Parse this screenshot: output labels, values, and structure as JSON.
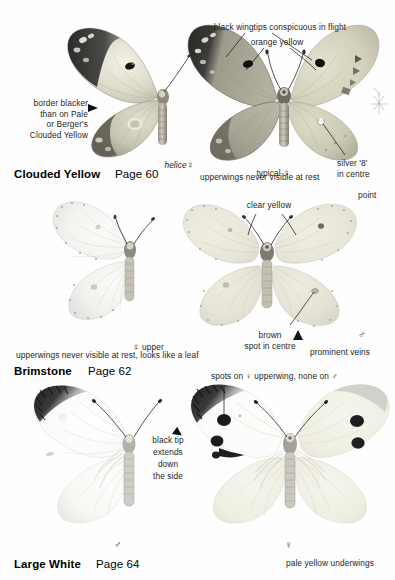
{
  "page": {
    "width": 395,
    "height": 580,
    "background": "#fefefe",
    "ink": "#1b1b1b"
  },
  "sections": [
    {
      "id": "clouded-yellow",
      "species_name": "Clouded Yellow",
      "page_ref": "Page 60",
      "specimens": [
        {
          "id": "helice-female",
          "caption": "helice",
          "sex_symbol": "♀",
          "form": "helice",
          "view": "upperside-left-half",
          "colors": {
            "wing": "#e8e3d4",
            "border": "#3a3a3a",
            "spot": "#1a1a1a"
          }
        },
        {
          "id": "typical-female",
          "caption": "typical",
          "sex_symbol": "♀",
          "form": "typical",
          "view": "split-upper-and-under",
          "colors": {
            "upper_wing": "#b9b4a4",
            "under_wing": "#d8d7c2",
            "border": "#2e2e2e",
            "spot": "#141414"
          }
        }
      ],
      "callouts": [
        {
          "id": "border-blacker",
          "text": "border blacker\nthan on Pale\nor Berger's\nClouded Yellow",
          "pointer": "arrow-right"
        },
        {
          "id": "black-wingtips",
          "text": "black wingtips conspicuous in flight",
          "pointer": "lines-to-both-forewings"
        },
        {
          "id": "orange-yellow",
          "text": "orange yellow",
          "pointer": "lines-to-wings"
        },
        {
          "id": "silver-8",
          "text": "silver '8'\nin centre",
          "pointer": "line-up-left"
        },
        {
          "id": "upperwings-note",
          "text": "upperwings never visible at rest",
          "pointer": "none"
        }
      ]
    },
    {
      "id": "brimstone",
      "species_name": "Brimstone",
      "page_ref": "Page 62",
      "specimens": [
        {
          "id": "female-upper",
          "caption": "upper",
          "sex_symbol": "♀",
          "view": "upperside-left-half",
          "colors": {
            "wing": "#f3f4f0",
            "vein": "#d3d5cf",
            "spot": "#cfd2cb"
          }
        },
        {
          "id": "male",
          "caption": "",
          "sex_symbol": "♂",
          "view": "underside-full",
          "colors": {
            "wing": "#ebe9df",
            "vein": "#d6d4c8",
            "spot": "#9a968a"
          }
        }
      ],
      "callouts": [
        {
          "id": "clear-yellow",
          "text": "clear yellow",
          "pointer": "lines-to-both-forewings"
        },
        {
          "id": "point",
          "text": "point",
          "pointer": "none"
        },
        {
          "id": "brown-spot",
          "text": "brown\nspot in centre",
          "pointer": "line-up-right"
        },
        {
          "id": "prominent-veins",
          "text": "prominent veins",
          "pointer": "arrow-up"
        },
        {
          "id": "leaf-note",
          "text": "upperwings never visible at rest, looks like a leaf",
          "pointer": "none"
        }
      ]
    },
    {
      "id": "large-white",
      "species_name": "Large White",
      "page_ref": "Page 64",
      "specimens": [
        {
          "id": "male",
          "caption": "",
          "sex_symbol": "♂",
          "view": "upperside-left-half",
          "colors": {
            "wing": "#fafafa",
            "tip": "#2a2a2a",
            "vein": "#dedede"
          }
        },
        {
          "id": "female",
          "caption": "",
          "sex_symbol": "♀",
          "view": "split-upper-and-under",
          "colors": {
            "wing": "#fbfbfb",
            "tip": "#222222",
            "spot": "#1c1c1c",
            "underwing": "#f0eee2"
          }
        }
      ],
      "callouts": [
        {
          "id": "black-tip",
          "text": "black tip\nextends\ndown\nthe side",
          "pointer": "arrow-up-right"
        },
        {
          "id": "spots-note",
          "text": "spots on ♀ upperwing, none on ♂",
          "pointer": "line-down-left"
        },
        {
          "id": "pale-yellow-underwings",
          "text": "pale yellow underwings",
          "pointer": "none"
        }
      ]
    }
  ],
  "symbols": {
    "female": "♀",
    "male": "♂"
  }
}
